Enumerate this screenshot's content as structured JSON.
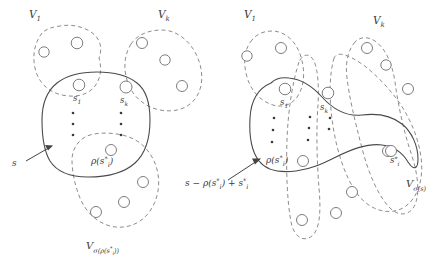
{
  "figure": {
    "name": "set-partition-swap-diagram",
    "width": 445,
    "height": 261,
    "colors": {
      "dashed_stroke": "#8d8d8d",
      "solid_stroke": "#4a4a4a",
      "node_stroke": "#7d7d7d",
      "node_fill": "#ffffff",
      "text": "#3a3a3a",
      "arrow": "#444444"
    }
  },
  "panels": [
    {
      "id": "left-panel",
      "name": "before-swap-panel",
      "labels": {
        "v1": "V",
        "v1_sub": "1",
        "vk": "V",
        "vk_sub": "k",
        "s1": "s",
        "s1_sub": "1",
        "sk": "s",
        "sk_sub": "k",
        "rho": "ρ(s",
        "rho_sup": "*",
        "rho_sub": "i",
        "rho_close": ")",
        "s_arrow": "s",
        "vsigma": "V",
        "vsigma_sub": "σ(ρ(s",
        "vsigma_sub_sup": "*",
        "vsigma_sub_i": "i",
        "vsigma_sub_close": "))"
      },
      "dots_columns": 2,
      "dots_per_column": 3
    },
    {
      "id": "right-panel",
      "name": "after-swap-panel",
      "labels": {
        "v1": "V",
        "v1_sub": "1",
        "vk": "V",
        "vk_sub": "k",
        "s1": "s",
        "s1_sub": "1",
        "sk": "s",
        "sk_sub": "k",
        "rho": "ρ(s",
        "rho_sup": "*",
        "rho_sub": "i",
        "rho_close": ")",
        "sstar": "s",
        "sstar_sup": "*",
        "sstar_sub": "i",
        "s_arrow": "s − ρ(s",
        "s_arrow_sup": "*",
        "s_arrow_sub": "i",
        "s_arrow_mid": ") + s",
        "s_arrow_sup2": "*",
        "s_arrow_sub2": "i",
        "vsigma": "V",
        "vsigma_sub": "σ(s)"
      },
      "dots_columns": 3,
      "dots_per_column": 3
    }
  ]
}
